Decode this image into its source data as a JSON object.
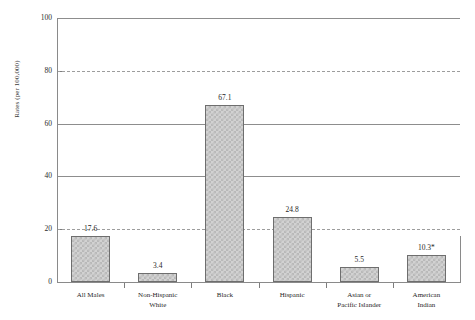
{
  "chart_data": {
    "type": "bar",
    "title": "",
    "xlabel": "",
    "ylabel": "Rates (per 100,000)",
    "ylim": [
      0,
      100
    ],
    "yticks": [
      0,
      20,
      40,
      60,
      80,
      100
    ],
    "ytick_labels": [
      "0",
      "20",
      "40",
      "60",
      "80",
      "100"
    ],
    "grid": true,
    "legend": "none",
    "categories": [
      "All Males",
      "Non-Hispanic White",
      "Black",
      "Hispanic",
      "Asian or Pacific Islander",
      "American Indian"
    ],
    "category_lines": [
      [
        "All Males"
      ],
      [
        "Non-Hispanic",
        "White"
      ],
      [
        "Black"
      ],
      [
        "Hispanic"
      ],
      [
        "Asian or",
        "Pacific Islander"
      ],
      [
        "American",
        "Indian"
      ]
    ],
    "values": [
      17.6,
      3.4,
      67.1,
      24.8,
      5.5,
      10.3
    ],
    "value_labels": [
      "17.6",
      "3.4",
      "67.1",
      "24.8",
      "5.5",
      "10.3*"
    ],
    "annotations": [
      "* estimate flagged with asterisk"
    ],
    "colors": {
      "bar_fill": "#d2d2d2",
      "bar_pattern": "#b9b9b9",
      "bar_edge": "#6e6e6e",
      "gridline": "#9a9a9a",
      "axis": "#8a8a8a",
      "text": "#1f1f1f",
      "background": "#ffffff"
    }
  }
}
